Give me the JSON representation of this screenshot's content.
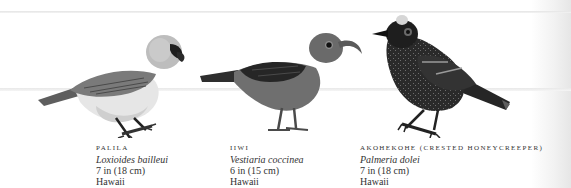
{
  "birds": [
    {
      "common_name": "Palila",
      "scientific_name": "Loxioides bailleui",
      "size": "7 in (18 cm)",
      "location": "Hawaii",
      "illustration": "palila-bird-icon"
    },
    {
      "common_name": "Iiwi",
      "scientific_name": "Vestiaria coccinea",
      "size": "6 in (15 cm)",
      "location": "Hawaii",
      "illustration": "iiwi-bird-icon"
    },
    {
      "common_name": "Akohekohe (crested honeycreeper)",
      "scientific_name": "Palmeria dolei",
      "size": "7 in (18 cm)",
      "location": "Hawaii",
      "illustration": "akohekohe-bird-icon"
    }
  ]
}
